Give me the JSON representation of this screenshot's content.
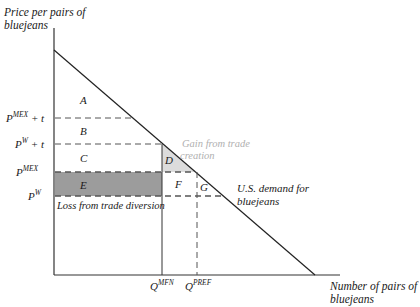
{
  "y_axis_label": {
    "line1": "Price per pairs of",
    "line2": "bluejeans"
  },
  "x_axis_label": {
    "line1": "Number of pairs of",
    "line2": "bluejeans"
  },
  "price_levels": [
    {
      "id": "pmex_t",
      "base": "P",
      "sup": "MEX",
      "suffix": " + t",
      "y": 118
    },
    {
      "id": "pw_t",
      "base": "P",
      "sup": "W",
      "suffix": " + t",
      "y": 144
    },
    {
      "id": "pmex",
      "base": "P",
      "sup": "MEX",
      "suffix": "",
      "y": 172
    },
    {
      "id": "pw",
      "base": "P",
      "sup": "W",
      "suffix": "",
      "y": 196
    }
  ],
  "quantity_levels": [
    {
      "id": "qmfn",
      "base": "Q",
      "sup": "MFN",
      "x": 162
    },
    {
      "id": "qpref",
      "base": "Q",
      "sup": "PREF",
      "x": 197
    }
  ],
  "regions": {
    "A": "A",
    "B": "B",
    "C": "C",
    "D": "D",
    "E": "E",
    "F": "F",
    "G": "G"
  },
  "annotations": {
    "gain_line1": "Gain from trade",
    "gain_line2": "creation",
    "loss": "Loss from trade diversion",
    "demand_line1": "U.S. demand for",
    "demand_line2": "bluejeans"
  },
  "colors": {
    "axis": "#333333",
    "dashed": "#555555",
    "shade_e": "#9c9c9c",
    "shade_d": "#dcdcdc",
    "gain_text": "#b0b0b0"
  }
}
